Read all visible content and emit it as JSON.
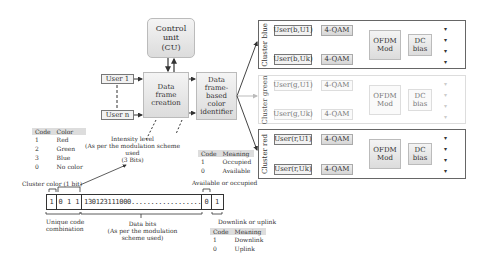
{
  "control_unit": {
    "label_l1": "Control",
    "label_l2": "unit",
    "label_l3": "(CU)"
  },
  "users": {
    "user1": "User 1",
    "usern": "User n"
  },
  "data_frame_creation": {
    "l1": "Data",
    "l2": "frame",
    "l3": "creation"
  },
  "color_identifier": {
    "l1": "Data",
    "l2": "frame-",
    "l3": "based",
    "l4": "color",
    "l5": "identifier"
  },
  "clusters": [
    {
      "name": "Cluster blue",
      "user_top": "User(b,U1)",
      "user_bottom": "User(b,Uk)",
      "qam": "4-QAM",
      "ofdm_l1": "OFDM",
      "ofdm_l2": "Mod",
      "dc_l1": "DC",
      "dc_l2": "bias",
      "faded": false
    },
    {
      "name": "Cluster green",
      "user_top": "User(g,U1)",
      "user_bottom": "User(g,Uk)",
      "qam": "4-QAM",
      "ofdm_l1": "OFDM",
      "ofdm_l2": "Mod",
      "dc_l1": "DC",
      "dc_l2": "bias",
      "faded": true
    },
    {
      "name": "Cluster red",
      "user_top": "User(r,U1)",
      "user_bottom": "User(r,Uk)",
      "qam": "4-QAM",
      "ofdm_l1": "OFDM",
      "ofdm_l2": "Mod",
      "dc_l1": "DC",
      "dc_l2": "bias",
      "faded": false
    }
  ],
  "color_table": {
    "headers": [
      "Code",
      "Color"
    ],
    "rows": [
      [
        "1",
        "Red"
      ],
      [
        "2",
        "Green"
      ],
      [
        "3",
        "Blue"
      ],
      [
        "0",
        "No color"
      ]
    ]
  },
  "occupied_table": {
    "headers": [
      "Code",
      "Meaning"
    ],
    "rows": [
      [
        "1",
        "Occupied"
      ],
      [
        "0",
        "Available"
      ]
    ]
  },
  "link_table": {
    "headers": [
      "Code",
      "Meaning"
    ],
    "rows": [
      [
        "1",
        "Downlink"
      ],
      [
        "0",
        "Uplink"
      ]
    ]
  },
  "annotations": {
    "intensity_l1": "Intensity level",
    "intensity_l2": "(As per the modulation scheme",
    "intensity_l3": "used",
    "intensity_l4": "(3 Bits)",
    "cluster_color": "Cluster color (1 bit)",
    "available_occupied": "Available or occupied",
    "unique_code_l1": "Unique code",
    "unique_code_l2": "combination",
    "data_bits_l1": "Data bits",
    "data_bits_l2": "(As per the modulation",
    "data_bits_l3": "scheme used)",
    "downlink_uplink": "Downlink or uplink"
  },
  "frame": {
    "cluster_bit": "1",
    "intensity_bits": "0 1 1",
    "data_bits": "130123111000..........................1322",
    "occupied_bit": "0",
    "link_bit": "1"
  }
}
